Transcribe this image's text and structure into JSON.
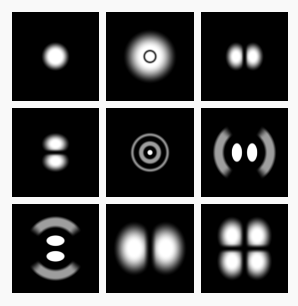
{
  "figure": {
    "caption": "",
    "background_color": "#f9f9f9",
    "panel_background_color": "#000000",
    "grid_rows": 3,
    "grid_cols": 3,
    "gap_px": 7,
    "width_px": 298,
    "height_px": 306
  },
  "chart_data": {
    "type": "heatmap",
    "xlabel": "",
    "ylabel": "",
    "legend_position": "none",
    "grid": false,
    "colormap": "grayscale",
    "colormap_low": "#000000",
    "colormap_high": "#ffffff",
    "layout": {
      "rows": 3,
      "cols": 3
    },
    "panels": [
      {
        "index": 0,
        "row": 0,
        "col": 0,
        "label": "1s",
        "pattern": "single-sphere",
        "nodes_radial": 0,
        "nodes_angular": 0,
        "lobes": 1,
        "peak_intensity": 1.0,
        "extent": 0.3,
        "orientation": "isotropic"
      },
      {
        "index": 1,
        "row": 0,
        "col": 1,
        "label": "2s",
        "pattern": "ring-with-core",
        "nodes_radial": 1,
        "nodes_angular": 0,
        "lobes": 1,
        "peak_intensity": 1.0,
        "extent": 0.52,
        "orientation": "isotropic",
        "shells": [
          {
            "r_inner": 0.0,
            "r_outer": 0.1,
            "intensity": 0.55
          },
          {
            "r_inner": 0.1,
            "r_outer": 0.155,
            "intensity": 0.0
          },
          {
            "r_inner": 0.155,
            "r_outer": 0.5,
            "intensity": 1.0
          }
        ]
      },
      {
        "index": 2,
        "row": 0,
        "col": 2,
        "label": "2p x",
        "pattern": "two-lobe",
        "nodes_radial": 0,
        "nodes_angular": 1,
        "lobes": 2,
        "peak_intensity": 1.0,
        "extent": 0.42,
        "orientation": "horizontal"
      },
      {
        "index": 3,
        "row": 1,
        "col": 0,
        "label": "2p z",
        "pattern": "two-lobe",
        "nodes_radial": 0,
        "nodes_angular": 1,
        "lobes": 2,
        "peak_intensity": 1.0,
        "extent": 0.42,
        "orientation": "vertical"
      },
      {
        "index": 4,
        "row": 1,
        "col": 1,
        "label": "3s",
        "pattern": "concentric-rings",
        "nodes_radial": 2,
        "nodes_angular": 0,
        "lobes": 1,
        "peak_intensity": 1.0,
        "extent": 0.88,
        "orientation": "isotropic",
        "shells": [
          {
            "r_inner": 0.0,
            "r_outer": 0.065,
            "intensity": 1.0
          },
          {
            "r_inner": 0.065,
            "r_outer": 0.115,
            "intensity": 0.0
          },
          {
            "r_inner": 0.115,
            "r_outer": 0.265,
            "intensity": 0.55
          },
          {
            "r_inner": 0.265,
            "r_outer": 0.33,
            "intensity": 0.0
          },
          {
            "r_inner": 0.33,
            "r_outer": 0.45,
            "intensity": 0.55
          }
        ]
      },
      {
        "index": 5,
        "row": 1,
        "col": 2,
        "label": "3p x",
        "pattern": "two-lobe-with-outer-crescents",
        "nodes_radial": 1,
        "nodes_angular": 1,
        "lobes": 4,
        "peak_intensity": 1.0,
        "inner_intensity": 1.0,
        "outer_intensity": 0.55,
        "extent": 0.9,
        "orientation": "horizontal"
      },
      {
        "index": 6,
        "row": 2,
        "col": 0,
        "label": "3p z",
        "pattern": "two-lobe-with-outer-crescents",
        "nodes_radial": 1,
        "nodes_angular": 1,
        "lobes": 4,
        "peak_intensity": 1.0,
        "inner_intensity": 1.0,
        "outer_intensity": 0.55,
        "extent": 0.9,
        "orientation": "vertical"
      },
      {
        "index": 7,
        "row": 2,
        "col": 1,
        "label": "3d z2",
        "pattern": "two-lobe",
        "nodes_radial": 0,
        "nodes_angular": 1,
        "lobes": 2,
        "peak_intensity": 1.0,
        "extent": 0.78,
        "orientation": "horizontal"
      },
      {
        "index": 8,
        "row": 2,
        "col": 2,
        "label": "3d xz",
        "pattern": "four-lobe-cloverleaf",
        "nodes_radial": 0,
        "nodes_angular": 2,
        "lobes": 4,
        "peak_intensity": 1.0,
        "extent": 0.72,
        "orientation": "diagonal"
      }
    ]
  }
}
